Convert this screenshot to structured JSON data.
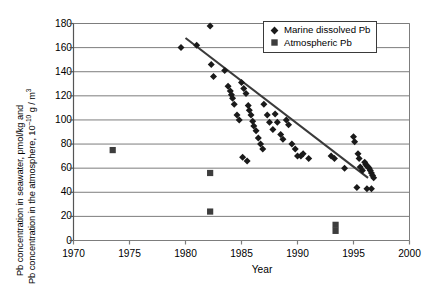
{
  "chart_data": {
    "type": "scatter",
    "title": "",
    "xlabel": "Year",
    "ylabel": "Pb concentration in seawater, pmol/kg and Pb concentration in the atmosphere, 10^-10 g / m^3",
    "ylabel_line1": "Pb concentration in seawater, pmol/kg and",
    "ylabel_line2_pre": "Pb concentration in the atmosphere, 10",
    "ylabel_line2_sup": "–10",
    "ylabel_line2_post": " g / m",
    "ylabel_line2_sup2": "3",
    "xlim": [
      1970,
      2000
    ],
    "ylim": [
      0,
      180
    ],
    "xticks": [
      1970,
      1975,
      1980,
      1985,
      1990,
      1995,
      2000
    ],
    "yticks": [
      0,
      20,
      40,
      60,
      80,
      100,
      120,
      140,
      160,
      180
    ],
    "grid": "horizontal",
    "legend_position": "top-right",
    "series": [
      {
        "name": "Marine dissolved Pb",
        "marker": "diamond",
        "color": "#1a1a1a",
        "points": [
          [
            1979.6,
            160
          ],
          [
            1981.0,
            162
          ],
          [
            1982.2,
            178
          ],
          [
            1982.3,
            146
          ],
          [
            1982.5,
            136
          ],
          [
            1983.5,
            141
          ],
          [
            1983.8,
            128
          ],
          [
            1984.0,
            124
          ],
          [
            1984.1,
            121
          ],
          [
            1984.2,
            118
          ],
          [
            1984.35,
            113
          ],
          [
            1984.6,
            104
          ],
          [
            1984.8,
            100
          ],
          [
            1985.0,
            131
          ],
          [
            1985.2,
            126
          ],
          [
            1985.4,
            122
          ],
          [
            1985.6,
            112
          ],
          [
            1985.7,
            108
          ],
          [
            1985.85,
            104
          ],
          [
            1986.0,
            99
          ],
          [
            1986.1,
            95
          ],
          [
            1986.3,
            91
          ],
          [
            1986.5,
            85
          ],
          [
            1986.7,
            80
          ],
          [
            1986.9,
            76
          ],
          [
            1985.1,
            69
          ],
          [
            1985.5,
            66
          ],
          [
            1987.0,
            113
          ],
          [
            1987.3,
            104
          ],
          [
            1987.5,
            98
          ],
          [
            1987.8,
            92
          ],
          [
            1988.0,
            105
          ],
          [
            1988.2,
            98
          ],
          [
            1988.5,
            88
          ],
          [
            1988.7,
            84
          ],
          [
            1989.0,
            100
          ],
          [
            1989.2,
            96
          ],
          [
            1989.5,
            80
          ],
          [
            1989.8,
            76
          ],
          [
            1990.0,
            70
          ],
          [
            1990.3,
            70
          ],
          [
            1990.5,
            72
          ],
          [
            1991.0,
            68
          ],
          [
            1993.0,
            70
          ],
          [
            1993.3,
            68
          ],
          [
            1995.0,
            86
          ],
          [
            1995.1,
            82
          ],
          [
            1995.4,
            72
          ],
          [
            1995.5,
            68
          ],
          [
            1995.6,
            61
          ],
          [
            1995.8,
            58
          ],
          [
            1996.0,
            65
          ],
          [
            1996.1,
            63
          ],
          [
            1996.2,
            62
          ],
          [
            1996.3,
            61
          ],
          [
            1996.4,
            60
          ],
          [
            1996.5,
            58
          ],
          [
            1996.6,
            56
          ],
          [
            1996.7,
            54
          ],
          [
            1996.8,
            52
          ],
          [
            1995.3,
            44
          ],
          [
            1996.2,
            43
          ],
          [
            1996.6,
            43
          ],
          [
            1994.2,
            60
          ]
        ]
      },
      {
        "name": "Atmospheric Pb",
        "marker": "square",
        "color": "#3d3d3d",
        "points": [
          [
            1973.5,
            75
          ],
          [
            1982.2,
            56
          ],
          [
            1982.2,
            24
          ],
          [
            1993.4,
            13
          ],
          [
            1993.4,
            8
          ]
        ]
      }
    ],
    "trendline": {
      "name": "linear-trend",
      "color": "#3a3a3a",
      "x0": 1980.0,
      "y0": 168,
      "x1": 1996.3,
      "y1": 52
    }
  },
  "legend": {
    "items": [
      {
        "label": "Marine dissolved Pb",
        "symbol": "diamond"
      },
      {
        "label": "Atmospheric Pb",
        "symbol": "square"
      }
    ]
  },
  "axes": {
    "x_tick_labels": [
      "1970",
      "1975",
      "1980",
      "1985",
      "1990",
      "1995",
      "2000"
    ],
    "y_tick_labels": [
      "0",
      "20",
      "40",
      "60",
      "80",
      "100",
      "120",
      "140",
      "160",
      "180"
    ],
    "x_axis_title": "Year"
  }
}
